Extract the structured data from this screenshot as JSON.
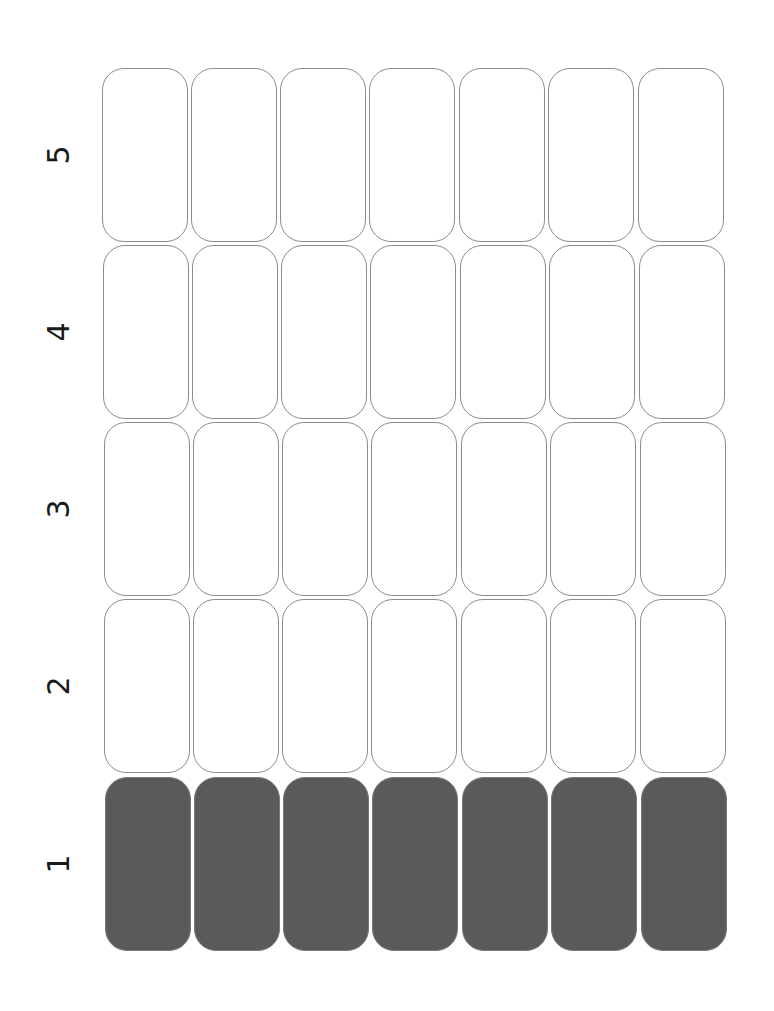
{
  "grid": {
    "rows": [
      {
        "label": "5",
        "filled": false
      },
      {
        "label": "4",
        "filled": false
      },
      {
        "label": "3",
        "filled": false
      },
      {
        "label": "2",
        "filled": false
      },
      {
        "label": "1",
        "filled": true
      }
    ],
    "columns": 7,
    "filled_color": "#5a5a5a",
    "empty_color": "#ffffff",
    "border_color": "#8c8c8c"
  }
}
